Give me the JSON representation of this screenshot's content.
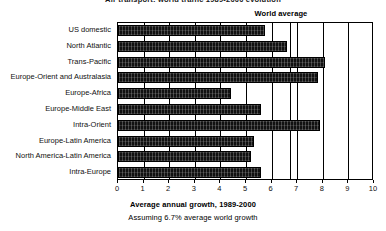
{
  "title": {
    "text": "Air transport: world traffic 1989-2000 evolution",
    "clipped": true
  },
  "annotation": {
    "world_average_label": "World average"
  },
  "axis": {
    "caption_primary": "Average annual growth, 1989-2000",
    "caption_secondary": "Assuming 6.7% average world growth",
    "tick_labels": [
      "0",
      "1",
      "2",
      "3",
      "4",
      "5",
      "6",
      "7",
      "8",
      "9",
      "10"
    ]
  },
  "colors": {
    "bar_fill": "#111111",
    "axis": "#000000",
    "background": "#ffffff"
  },
  "chart_data": {
    "type": "bar",
    "orientation": "horizontal",
    "title": "Air transport: world traffic 1989-2000 evolution",
    "xlabel": "Average annual growth, 1989-2000",
    "ylabel": "",
    "xlim": [
      0,
      10
    ],
    "grid": true,
    "legend": false,
    "categories": [
      "US domestic",
      "North Atlantic",
      "Trans-Pacific",
      "Europe-Orient and Australasia",
      "Europe-Africa",
      "Europe-Middle East",
      "Intra-Orient",
      "Europe-Latin America",
      "North America-Latin America",
      "Intra-Europe"
    ],
    "values": [
      5.75,
      6.6,
      8.1,
      7.8,
      4.4,
      5.6,
      7.9,
      5.3,
      5.2,
      5.6
    ],
    "xticks": [
      0,
      1,
      2,
      3,
      4,
      5,
      6,
      7,
      8,
      9,
      10
    ],
    "annotations": [
      {
        "label": "World average",
        "value": 6.7,
        "type": "vertical-reference-line"
      }
    ],
    "subtitle": "Assuming 6.7% average world growth"
  }
}
